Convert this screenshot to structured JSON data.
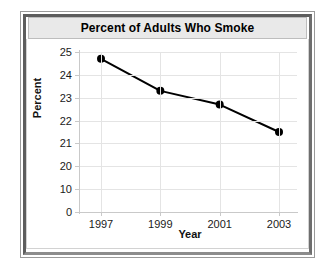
{
  "chart_data": {
    "type": "line",
    "title": "Percent of Adults Who Smoke",
    "xlabel": "Year",
    "ylabel": "Percent",
    "x": [
      1997,
      1999,
      2001,
      2003
    ],
    "categories": [
      "1997",
      "1999",
      "2001",
      "2003"
    ],
    "values": [
      24.7,
      23.3,
      22.7,
      21.5
    ],
    "series": [
      {
        "name": "Percent of Adults Who Smoke",
        "values": [
          24.7,
          23.3,
          22.7,
          21.5
        ]
      }
    ],
    "x_tick_labels": [
      "1997",
      "1999",
      "2001",
      "2003"
    ],
    "y_tick_labels": [
      "25",
      "24",
      "23",
      "22",
      "21",
      "20",
      "10",
      "0"
    ],
    "y_tick_values": [
      25,
      24,
      23,
      22,
      21,
      20,
      10,
      0
    ],
    "y_axis_note": "Broken axis: ticks evenly spaced though 0-10-20 intervals are compressed",
    "ylim": [
      0,
      25
    ],
    "xlim": [
      1997,
      2003
    ],
    "grid": true,
    "legend": false,
    "legend_position": "none",
    "marker": "filled-circle",
    "line_color": "#000000",
    "marker_color": "#000000",
    "grid_color": "#e4e4e4",
    "title_background": "#e9e9e9",
    "frame_color": "#5d5d5d"
  }
}
